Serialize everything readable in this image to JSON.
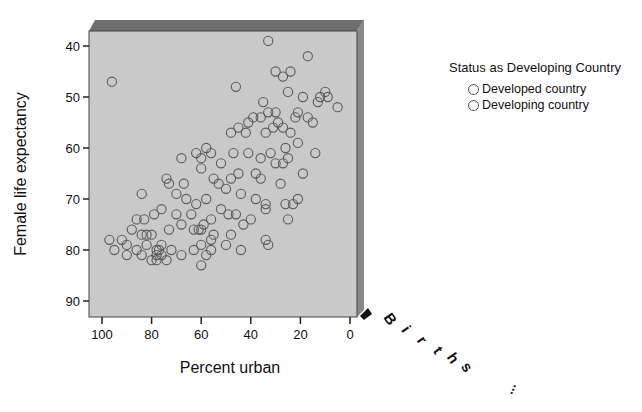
{
  "chart_data": {
    "type": "scatter",
    "title": "",
    "xlabel": "Percent urban",
    "ylabel": "Female life expectancy",
    "zlabel": "Births ...",
    "x_axis_reversed": true,
    "y_axis_reversed": true,
    "xlim": [
      103,
      -2
    ],
    "ylim": [
      37,
      93
    ],
    "x_ticks": [
      "100",
      "80",
      "60",
      "40",
      "20",
      "0"
    ],
    "y_ticks": [
      "40",
      "50",
      "60",
      "70",
      "80",
      "90"
    ],
    "grid": false,
    "legend_position": "right",
    "legend": {
      "title": "Status as Developing Country",
      "entries": [
        "Developed country",
        "Developing country"
      ]
    },
    "series": [
      {
        "name": "All countries",
        "points": [
          [
            96,
            47
          ],
          [
            33,
            39
          ],
          [
            24,
            45
          ],
          [
            17,
            42
          ],
          [
            30,
            45
          ],
          [
            27,
            46
          ],
          [
            25,
            49
          ],
          [
            35,
            51
          ],
          [
            19,
            50
          ],
          [
            30,
            53
          ],
          [
            9,
            50
          ],
          [
            12,
            50
          ],
          [
            5,
            52
          ],
          [
            13,
            51
          ],
          [
            33,
            53
          ],
          [
            29,
            55
          ],
          [
            31,
            56
          ],
          [
            17,
            54
          ],
          [
            21,
            53
          ],
          [
            24,
            57
          ],
          [
            27,
            56
          ],
          [
            22,
            54
          ],
          [
            10,
            49
          ],
          [
            46,
            48
          ],
          [
            39,
            54
          ],
          [
            36,
            54
          ],
          [
            41,
            55
          ],
          [
            34,
            57
          ],
          [
            42,
            57
          ],
          [
            45,
            56
          ],
          [
            48,
            57
          ],
          [
            52,
            63
          ],
          [
            58,
            60
          ],
          [
            56,
            61
          ],
          [
            60,
            62
          ],
          [
            62,
            61
          ],
          [
            45,
            65
          ],
          [
            47,
            61
          ],
          [
            41,
            61
          ],
          [
            36,
            62
          ],
          [
            38,
            65
          ],
          [
            32,
            61
          ],
          [
            30,
            63
          ],
          [
            27,
            63
          ],
          [
            25,
            62
          ],
          [
            26,
            60
          ],
          [
            21,
            59
          ],
          [
            15,
            55
          ],
          [
            14,
            61
          ],
          [
            55,
            66
          ],
          [
            53,
            67
          ],
          [
            50,
            68
          ],
          [
            48,
            66
          ],
          [
            44,
            69
          ],
          [
            38,
            70
          ],
          [
            34,
            71
          ],
          [
            34,
            72
          ],
          [
            36,
            66
          ],
          [
            28,
            67
          ],
          [
            19,
            65
          ],
          [
            23,
            71
          ],
          [
            26,
            71
          ],
          [
            25,
            74
          ],
          [
            21,
            70
          ],
          [
            60,
            64
          ],
          [
            67,
            67
          ],
          [
            68,
            62
          ],
          [
            74,
            66
          ],
          [
            73,
            67
          ],
          [
            84,
            69
          ],
          [
            79,
            73
          ],
          [
            76,
            72
          ],
          [
            70,
            73
          ],
          [
            68,
            75
          ],
          [
            73,
            76
          ],
          [
            63,
            76
          ],
          [
            61,
            76
          ],
          [
            59,
            75
          ],
          [
            56,
            74
          ],
          [
            52,
            72
          ],
          [
            49,
            73
          ],
          [
            46,
            73
          ],
          [
            43,
            75
          ],
          [
            40,
            74
          ],
          [
            58,
            70
          ],
          [
            62,
            71
          ],
          [
            64,
            73
          ],
          [
            66,
            70
          ],
          [
            70,
            69
          ],
          [
            82,
            77
          ],
          [
            88,
            76
          ],
          [
            90,
            79
          ],
          [
            92,
            78
          ],
          [
            86,
            80
          ],
          [
            84,
            81
          ],
          [
            90,
            81
          ],
          [
            97,
            78
          ],
          [
            95,
            80
          ],
          [
            78,
            80
          ],
          [
            76,
            79
          ],
          [
            77,
            80
          ],
          [
            78,
            81
          ],
          [
            76,
            81
          ],
          [
            74,
            82
          ],
          [
            78,
            82
          ],
          [
            72,
            80
          ],
          [
            68,
            81
          ],
          [
            63,
            80
          ],
          [
            60,
            79
          ],
          [
            58,
            81
          ],
          [
            56,
            80
          ],
          [
            60,
            83
          ],
          [
            50,
            79
          ],
          [
            48,
            77
          ],
          [
            44,
            80
          ],
          [
            55,
            77
          ],
          [
            56,
            78
          ],
          [
            60,
            76
          ],
          [
            34,
            78
          ],
          [
            33,
            79
          ],
          [
            80,
            82
          ],
          [
            82,
            79
          ],
          [
            86,
            74
          ],
          [
            83,
            74
          ],
          [
            84,
            77
          ],
          [
            80,
            77
          ]
        ]
      }
    ]
  },
  "axes": {
    "x_label": "Percent urban",
    "y_label": "Female life expectancy",
    "z_label_letters": [
      "B",
      "i",
      "r",
      "t",
      "h",
      "s"
    ],
    "z_label_ellipsis": "..."
  },
  "legend": {
    "title": "Status as Developing Country",
    "items": [
      {
        "label": "Developed country"
      },
      {
        "label": "Developing country"
      }
    ]
  },
  "colors": {
    "plot_face": "#c8c8c8",
    "plot_top": "#6e6e6e",
    "plot_side": "#8a8a8a",
    "marker_stroke": "#5a5a5a"
  }
}
